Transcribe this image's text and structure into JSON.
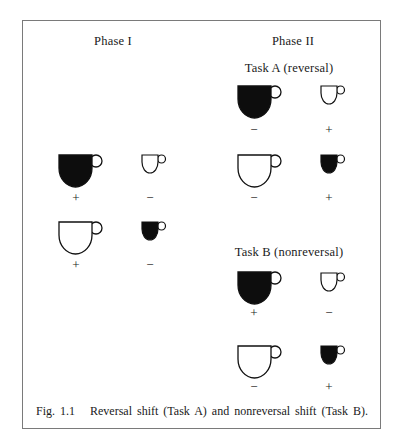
{
  "figure": {
    "phase1": {
      "title": "Phase I",
      "rows": [
        {
          "items": [
            {
              "size": "large",
              "color": "black",
              "sign": "+"
            },
            {
              "size": "small",
              "color": "white",
              "sign": "−"
            }
          ]
        },
        {
          "items": [
            {
              "size": "large",
              "color": "white",
              "sign": "+"
            },
            {
              "size": "small",
              "color": "black",
              "sign": "−"
            }
          ]
        }
      ]
    },
    "phase2": {
      "title": "Phase II",
      "taskA": {
        "title": "Task A (reversal)",
        "rows": [
          {
            "items": [
              {
                "size": "large",
                "color": "black",
                "sign": "−"
              },
              {
                "size": "small",
                "color": "white",
                "sign": "+"
              }
            ]
          },
          {
            "items": [
              {
                "size": "large",
                "color": "white",
                "sign": "−"
              },
              {
                "size": "small",
                "color": "black",
                "sign": "+"
              }
            ]
          }
        ]
      },
      "taskB": {
        "title": "Task B (nonreversal)",
        "rows": [
          {
            "items": [
              {
                "size": "large",
                "color": "black",
                "sign": "+"
              },
              {
                "size": "small",
                "color": "white",
                "sign": "−"
              }
            ]
          },
          {
            "items": [
              {
                "size": "large",
                "color": "white",
                "sign": "−"
              },
              {
                "size": "small",
                "color": "black",
                "sign": "+"
              }
            ]
          }
        ]
      }
    },
    "caption": "Fig. 1.1   Reversal shift (Task A) and nonreversal shift (Task B).",
    "colors": {
      "fill_black": "#0d0d0d",
      "stroke": "#111111",
      "frame": "#7a7a7a"
    }
  }
}
